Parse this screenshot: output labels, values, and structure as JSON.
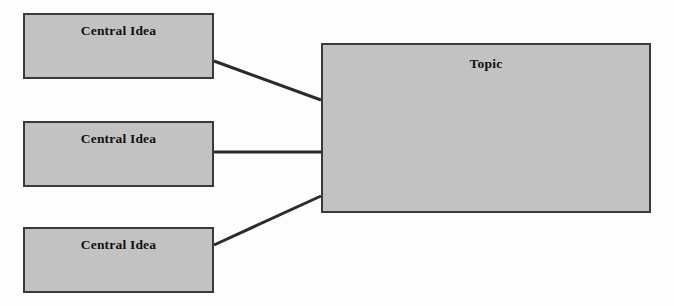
{
  "diagram": {
    "type": "concept-map",
    "background_color": "#fdfdfd",
    "node_fill_color": "#c2c2c2",
    "node_border_color": "#3a3a3a",
    "connector_color": "#2b2b2b",
    "nodes": [
      {
        "id": "idea-1",
        "label": "Central Idea",
        "role": "central-idea",
        "x": 23,
        "y": 13,
        "width": 191,
        "height": 66
      },
      {
        "id": "idea-2",
        "label": "Central Idea",
        "role": "central-idea",
        "x": 23,
        "y": 121,
        "width": 191,
        "height": 66
      },
      {
        "id": "idea-3",
        "label": "Central Idea",
        "role": "central-idea",
        "x": 23,
        "y": 227,
        "width": 191,
        "height": 66
      },
      {
        "id": "topic",
        "label": "Topic",
        "role": "topic",
        "x": 321,
        "y": 43,
        "width": 330,
        "height": 170
      }
    ],
    "connectors": [
      {
        "id": "connector-1",
        "from": "idea-1",
        "to": "topic",
        "x1": 214,
        "y1": 61,
        "x2": 321,
        "y2": 100
      },
      {
        "id": "connector-2",
        "from": "idea-2",
        "to": "topic",
        "x1": 214,
        "y1": 152,
        "x2": 321,
        "y2": 152
      },
      {
        "id": "connector-3",
        "from": "idea-3",
        "to": "topic",
        "x1": 214,
        "y1": 245,
        "x2": 321,
        "y2": 196
      }
    ]
  }
}
